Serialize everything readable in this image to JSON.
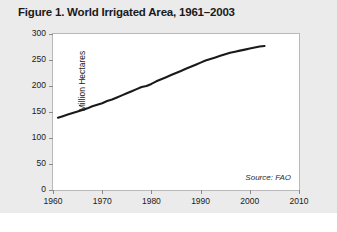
{
  "figure": {
    "title": "Figure 1. World Irrigated Area, 1961–2003",
    "source_note": "Source: FAO",
    "panel_background": "#ebebeb",
    "plot_background": "#ffffff",
    "line_color": "#1a1a1a",
    "axis_color": "#b9b9b9"
  },
  "chart_data": {
    "type": "line",
    "title": "Figure 1. World Irrigated Area, 1961–2003",
    "xlabel": "",
    "ylabel": "Million Hectares",
    "xlim": [
      1960,
      2010
    ],
    "ylim": [
      0,
      300
    ],
    "xticks": [
      1960,
      1970,
      1980,
      1990,
      2000,
      2010
    ],
    "yticks": [
      0,
      50,
      100,
      150,
      200,
      250,
      300
    ],
    "grid": false,
    "legend": null,
    "annotations": [
      "Source: FAO"
    ],
    "series": [
      {
        "name": "World Irrigated Area",
        "color": "#1a1a1a",
        "x": [
          1961,
          1962,
          1963,
          1964,
          1965,
          1966,
          1967,
          1968,
          1969,
          1970,
          1971,
          1972,
          1973,
          1974,
          1975,
          1976,
          1977,
          1978,
          1979,
          1980,
          1981,
          1982,
          1983,
          1984,
          1985,
          1986,
          1987,
          1988,
          1989,
          1990,
          1991,
          1992,
          1993,
          1994,
          1995,
          1996,
          1997,
          1998,
          1999,
          2000,
          2001,
          2002,
          2003
        ],
        "values": [
          139,
          142,
          145,
          148,
          151,
          154,
          157,
          161,
          164,
          167,
          171,
          174,
          178,
          182,
          186,
          190,
          194,
          198,
          200,
          204,
          209,
          213,
          217,
          221,
          225,
          229,
          233,
          237,
          241,
          245,
          249,
          252,
          255,
          258,
          261,
          264,
          266,
          268,
          270,
          272,
          274,
          276,
          277
        ]
      }
    ]
  }
}
